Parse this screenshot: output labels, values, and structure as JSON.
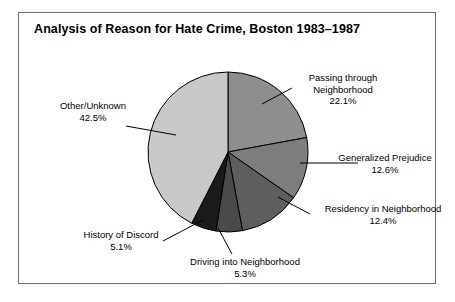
{
  "figure": {
    "title": "Analysis of Reason for Hate Crime, Boston 1983–1987",
    "frame_color": "#6e6e6e",
    "background": "#ffffff"
  },
  "chart_data": {
    "type": "pie",
    "title": "Analysis of Reason for Hate Crime, Boston 1983–1987",
    "xlabel": "",
    "ylabel": "",
    "units": "percent",
    "start_angle_deg": 0,
    "direction": "clockwise",
    "legend": "none (direct labels with leader lines)",
    "grid": false,
    "categories": [
      "Passing through Neighborhood",
      "Generalized Prejudice",
      "Residency in Neighborhood",
      "Driving into Neighborhood",
      "History of Discord",
      "Other/Unknown"
    ],
    "values": [
      22.1,
      12.6,
      12.4,
      5.3,
      5.1,
      42.5
    ],
    "colors": [
      "#8e8e8e",
      "#7d7d7d",
      "#5e5e5e",
      "#4a4a4a",
      "#1a1a1a",
      "#c8c8c8"
    ],
    "slices": [
      {
        "label": "Passing through Neighborhood",
        "label_line1": "Passing through",
        "label_line2": "Neighborhood",
        "value": 22.1,
        "percent_text": "22.1%",
        "color": "#8e8e8e"
      },
      {
        "label": "Generalized Prejudice",
        "label_line1": "Generalized Prejudice",
        "label_line2": "",
        "value": 12.6,
        "percent_text": "12.6%",
        "color": "#7d7d7d"
      },
      {
        "label": "Residency in Neighborhood",
        "label_line1": "Residency in Neighborhood",
        "label_line2": "",
        "value": 12.4,
        "percent_text": "12.4%",
        "color": "#5e5e5e"
      },
      {
        "label": "Driving into Neighborhood",
        "label_line1": "Driving into Neighborhood",
        "label_line2": "",
        "value": 5.3,
        "percent_text": "5.3%",
        "color": "#4a4a4a"
      },
      {
        "label": "History of Discord",
        "label_line1": "History of Discord",
        "label_line2": "",
        "value": 5.1,
        "percent_text": "5.1%",
        "color": "#1a1a1a"
      },
      {
        "label": "Other/Unknown",
        "label_line1": "Other/Unknown",
        "label_line2": "",
        "value": 42.5,
        "percent_text": "42.5%",
        "color": "#c8c8c8"
      }
    ]
  }
}
